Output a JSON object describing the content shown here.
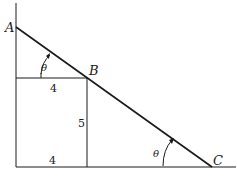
{
  "diagram": {
    "points": {
      "A": "A",
      "B": "B",
      "C": "C"
    },
    "angles": {
      "theta_top": "θ",
      "theta_bottom": "θ"
    },
    "lengths": {
      "top_horizontal": "4",
      "vertical_b": "5",
      "bottom_horizontal": "4"
    },
    "colors": {
      "stroke": "#1a1a1a",
      "background": "#ffffff"
    }
  }
}
